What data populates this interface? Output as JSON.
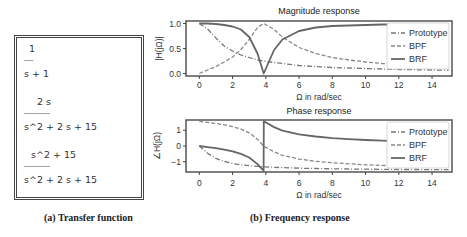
{
  "transfer_function": {
    "caption": "(a) Transfer function",
    "prototype": {
      "num": "1",
      "bar": "-----",
      "den": "s + 1"
    },
    "bpf": {
      "num": "2 s",
      "bar": "--------------",
      "den": "s^2 + 2 s + 15"
    },
    "brf": {
      "num": "s^2 + 15",
      "bar": "--------------",
      "den": "s^2 + 2 s + 15"
    }
  },
  "frequency_caption": "(b) Frequency response",
  "chart_data": [
    {
      "type": "line",
      "title": "Magnitude response",
      "xlabel": "Ω in rad/sec",
      "ylabel": "|H(jΩ)|",
      "xlim": [
        -0.8,
        15.2
      ],
      "ylim": [
        -0.05,
        1.05
      ],
      "xticks": [
        "0",
        "2",
        "4",
        "6",
        "8",
        "10",
        "12",
        "14"
      ],
      "yticks": [
        "0.0",
        "0.5",
        "1.0"
      ],
      "grid": false,
      "legend_position": "upper right",
      "x": [
        0,
        0.5,
        1,
        1.5,
        2,
        2.5,
        3,
        3.5,
        3.873,
        4.5,
        5,
        6,
        7,
        8,
        9,
        10,
        11,
        12,
        13,
        14,
        15
      ],
      "series": [
        {
          "name": "Prototype",
          "style": "dashdot",
          "values": [
            1.0,
            0.89,
            0.71,
            0.55,
            0.45,
            0.37,
            0.32,
            0.27,
            0.25,
            0.22,
            0.2,
            0.16,
            0.14,
            0.12,
            0.11,
            0.1,
            0.09,
            0.08,
            0.077,
            0.071,
            0.066
          ]
        },
        {
          "name": "BPF",
          "style": "dashed",
          "values": [
            0.0,
            0.07,
            0.14,
            0.23,
            0.33,
            0.48,
            0.68,
            0.92,
            1.0,
            0.88,
            0.73,
            0.52,
            0.4,
            0.32,
            0.27,
            0.23,
            0.2,
            0.18,
            0.16,
            0.15,
            0.14
          ]
        },
        {
          "name": "BRF",
          "style": "solid",
          "values": [
            1.0,
            1.0,
            0.99,
            0.97,
            0.94,
            0.88,
            0.73,
            0.4,
            0.0,
            0.47,
            0.68,
            0.85,
            0.92,
            0.95,
            0.96,
            0.97,
            0.98,
            0.98,
            0.99,
            0.99,
            0.99
          ]
        }
      ]
    },
    {
      "type": "line",
      "title": "Phase response",
      "xlabel": "Ω in rad/sec",
      "ylabel": "∠H(jΩ)",
      "xlim": [
        -0.8,
        15.2
      ],
      "ylim": [
        -1.65,
        1.65
      ],
      "xticks": [
        "0",
        "2",
        "4",
        "6",
        "8",
        "10",
        "12",
        "14"
      ],
      "yticks": [
        "-1",
        "0",
        "1"
      ],
      "grid": false,
      "legend_position": "upper right",
      "x": [
        0,
        0.5,
        1,
        1.5,
        2,
        2.5,
        3,
        3.5,
        3.87,
        3.88,
        4.5,
        5,
        6,
        7,
        8,
        9,
        10,
        11,
        12,
        13,
        14,
        15
      ],
      "series": [
        {
          "name": "Prototype",
          "style": "dashdot",
          "values": [
            0.0,
            -0.46,
            -0.79,
            -0.98,
            -1.11,
            -1.19,
            -1.25,
            -1.29,
            -1.32,
            -1.32,
            -1.35,
            -1.37,
            -1.41,
            -1.43,
            -1.45,
            -1.46,
            -1.47,
            -1.48,
            -1.49,
            -1.49,
            -1.5,
            -1.5
          ]
        },
        {
          "name": "BPF",
          "style": "dashed",
          "values": [
            1.57,
            1.5,
            1.43,
            1.34,
            1.23,
            1.07,
            0.84,
            0.42,
            0.0,
            -0.02,
            -0.37,
            -0.59,
            -0.83,
            -0.97,
            -1.06,
            -1.13,
            -1.19,
            -1.23,
            -1.27,
            -1.3,
            -1.32,
            -1.35
          ]
        },
        {
          "name": "BRF",
          "style": "solid",
          "values": [
            0.0,
            -0.07,
            -0.14,
            -0.23,
            -0.34,
            -0.5,
            -0.73,
            -1.15,
            -1.57,
            1.57,
            1.2,
            0.98,
            0.74,
            0.6,
            0.5,
            0.44,
            0.38,
            0.34,
            0.3,
            0.27,
            0.25,
            0.23
          ]
        }
      ]
    }
  ]
}
